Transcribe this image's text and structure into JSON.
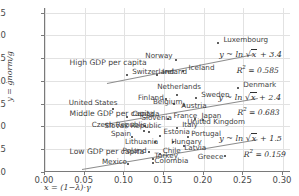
{
  "chart_data": {
    "type": "scatter",
    "title": "",
    "xlabel": "x = (1−λ)·γ",
    "ylabel": "y = ġnorm/g",
    "xlim": [
      0.0,
      0.31
    ],
    "ylim": [
      0.0,
      3.6
    ],
    "xticks": [
      "0.00",
      "0.05",
      "0.10",
      "0.15",
      "0.20",
      "0.25",
      "0.30"
    ],
    "xtick_values": [
      0.0,
      0.05,
      0.1,
      0.15,
      0.2,
      0.25,
      0.3
    ],
    "yticks": [
      "0.0",
      "0.5",
      "1.0",
      "1.5",
      "2.0",
      "2.5",
      "3.0",
      "3.5"
    ],
    "ytick_values": [
      0.0,
      0.5,
      1.0,
      1.5,
      2.0,
      2.5,
      3.0,
      3.5
    ],
    "grid": true,
    "legend": "none",
    "group_labels": [
      {
        "text": "High GDP per capita",
        "x": 0.031,
        "y": 2.42
      },
      {
        "text": "Middle GDP per capita",
        "x": 0.031,
        "y": 1.29
      },
      {
        "text": "Low GDP per capita",
        "x": 0.031,
        "y": 0.47
      }
    ],
    "points": [
      {
        "label": "Switzerland",
        "x": 0.1035,
        "y": 2.13,
        "lx": 5,
        "ly": -3
      },
      {
        "label": "Ireland",
        "x": 0.1415,
        "y": 2.13,
        "lx": 5,
        "ly": -3
      },
      {
        "label": "Norway",
        "x": 0.1655,
        "y": 2.46,
        "lx": -31,
        "ly": -4
      },
      {
        "label": "Iceland",
        "x": 0.1745,
        "y": 2.22,
        "lx": 5,
        "ly": -3
      },
      {
        "label": "Luxembourg",
        "x": 0.2185,
        "y": 2.83,
        "lx": 5,
        "ly": -3
      },
      {
        "label": "Denmark",
        "x": 0.2435,
        "y": 1.84,
        "lx": 5,
        "ly": -3
      },
      {
        "label": "Finland",
        "x": 0.1525,
        "y": 1.6,
        "lx": -28,
        "ly": -1
      },
      {
        "label": "Netherlands",
        "x": 0.1665,
        "y": 1.7,
        "lx": -20,
        "ly": -8
      },
      {
        "label": "Sweden",
        "x": 0.1905,
        "y": 1.62,
        "lx": 5,
        "ly": -3
      },
      {
        "label": "Belgium",
        "x": 0.1625,
        "y": 1.5,
        "lx": -21,
        "ly": -2
      },
      {
        "label": "Austria",
        "x": 0.1755,
        "y": 1.47,
        "lx": -3,
        "ly": 1
      },
      {
        "label": "United States",
        "x": 0.0855,
        "y": 1.39,
        "lx": -44,
        "ly": -6
      },
      {
        "label": "Canada",
        "x": 0.1035,
        "y": 1.2,
        "lx": 5,
        "ly": -3
      },
      {
        "label": "France",
        "x": 0.1555,
        "y": 1.17,
        "lx": 5,
        "ly": -3
      },
      {
        "label": "Japan",
        "x": 0.1895,
        "y": 1.17,
        "lx": 6,
        "ly": -3
      },
      {
        "label": "United Kingdom",
        "x": 0.1995,
        "y": 1.15,
        "lx": -16,
        "ly": 2
      },
      {
        "label": "Slovenia",
        "x": 0.1265,
        "y": 1.02,
        "lx": -4,
        "ly": -8
      },
      {
        "label": "Italy",
        "x": 0.1665,
        "y": 0.97,
        "lx": 5,
        "ly": -3
      },
      {
        "label": "Czech Republic",
        "x": 0.1245,
        "y": 0.9,
        "lx": -52,
        "ly": -6
      },
      {
        "label": "Slovak Republic",
        "x": 0.1305,
        "y": 0.87,
        "lx": -44,
        "ly": -6
      },
      {
        "label": "Estonia",
        "x": 0.1455,
        "y": 0.8,
        "lx": 3,
        "ly": -4
      },
      {
        "label": "Spain",
        "x": 0.1095,
        "y": 0.76,
        "lx": -21,
        "ly": -3
      },
      {
        "label": "Portugal",
        "x": 0.1805,
        "y": 0.76,
        "lx": 3,
        "ly": -3
      },
      {
        "label": "Lithuania",
        "x": 0.1385,
        "y": 0.66,
        "lx": -30,
        "ly": 0
      },
      {
        "label": "Hungary",
        "x": 0.1615,
        "y": 0.66,
        "lx": -2,
        "ly": 0
      },
      {
        "label": "Latvia",
        "x": 0.1755,
        "y": 0.56,
        "lx": 0,
        "ly": 2
      },
      {
        "label": "Poland",
        "x": 0.1305,
        "y": 0.43,
        "lx": -26,
        "ly": -1
      },
      {
        "label": "Chile",
        "x": 0.1445,
        "y": 0.4,
        "lx": 3,
        "ly": -3
      },
      {
        "label": "Turkey",
        "x": 0.1355,
        "y": 0.29,
        "lx": 2,
        "ly": -3
      },
      {
        "label": "Greece",
        "x": 0.2265,
        "y": 0.36,
        "lx": -27,
        "ly": 1
      },
      {
        "label": "Colombia",
        "x": 0.1355,
        "y": 0.19,
        "lx": 2,
        "ly": -2
      },
      {
        "label": "Mexico",
        "x": 0.1045,
        "y": 0.17,
        "lx": -26,
        "ly": -2
      }
    ],
    "fits": [
      {
        "name": "high-gdp-fit",
        "equation": "y ~ ln √x + 3.4",
        "r2_label": "R² = 0.585",
        "intercept": 3.4,
        "x0": 0.078,
        "y0": 1.95,
        "x1": 0.262,
        "y1": 2.58,
        "eq_x": 0.2195,
        "eq_y": 2.56,
        "r2_x": 0.2415,
        "r2_y": 2.27
      },
      {
        "name": "middle-gdp-fit",
        "equation": "y ~ ln √x + 2.4",
        "r2_label": "R² = 0.683",
        "intercept": 2.4,
        "x0": 0.076,
        "y0": 1.05,
        "x1": 0.268,
        "y1": 1.62,
        "eq_x": 0.2185,
        "eq_y": 1.62,
        "r2_x": 0.2425,
        "r2_y": 1.33
      },
      {
        "name": "low-gdp-fit",
        "equation": "y ~ ln √x + 1.5",
        "r2_label": "R² = 0.159",
        "intercept": 1.5,
        "x0": 0.047,
        "y0": 0.07,
        "x1": 0.268,
        "y1": 0.72,
        "eq_x": 0.2195,
        "eq_y": 0.72,
        "r2_x": 0.2505,
        "r2_y": 0.42
      }
    ]
  }
}
